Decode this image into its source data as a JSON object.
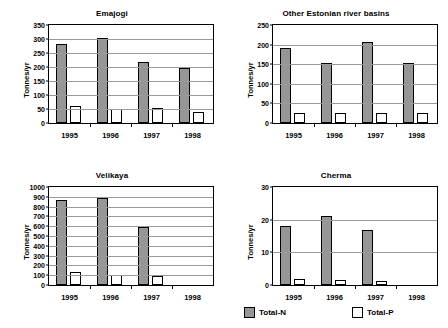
{
  "figure": {
    "ylabel": "Tonnes/yr",
    "series_colors": {
      "Total-N": "#969696",
      "Total-P": "#ffffff"
    },
    "legend": {
      "position": "bottom-right",
      "entries": [
        {
          "label": "Total-N",
          "swatch": "total-n-swatch"
        },
        {
          "label": "Total-P",
          "swatch": "total-p-swatch"
        }
      ]
    }
  },
  "chart_data": [
    {
      "type": "bar",
      "title": "Emajogi",
      "xlabel": "",
      "ylabel": "Tonnes/yr",
      "categories": [
        "1995",
        "1996",
        "1997",
        "1998"
      ],
      "ylim": [
        0,
        350
      ],
      "yticks": [
        0,
        50,
        100,
        150,
        200,
        250,
        300,
        350
      ],
      "grid": true,
      "series": [
        {
          "name": "Total-N",
          "values": [
            283,
            304,
            217,
            196
          ]
        },
        {
          "name": "Total-P",
          "values": [
            60,
            50,
            55,
            38
          ]
        }
      ]
    },
    {
      "type": "bar",
      "title": "Other Estonian river basins",
      "xlabel": "",
      "ylabel": "Tonnes/yr",
      "categories": [
        "1995",
        "1996",
        "1997",
        "1998"
      ],
      "ylim": [
        0,
        250
      ],
      "yticks": [
        0,
        50,
        100,
        150,
        200,
        250
      ],
      "grid": true,
      "series": [
        {
          "name": "Total-N",
          "values": [
            192,
            153,
            207,
            152
          ]
        },
        {
          "name": "Total-P",
          "values": [
            25,
            25,
            26,
            25
          ]
        }
      ]
    },
    {
      "type": "bar",
      "title": "Velikaya",
      "xlabel": "",
      "ylabel": "Tonnes/yr",
      "categories": [
        "1995",
        "1996",
        "1997",
        "1998"
      ],
      "ylim": [
        0,
        1000
      ],
      "yticks": [
        0,
        100,
        200,
        300,
        400,
        500,
        600,
        700,
        800,
        900,
        1000
      ],
      "grid": true,
      "series": [
        {
          "name": "Total-N",
          "values": [
            865,
            890,
            592,
            null
          ]
        },
        {
          "name": "Total-P",
          "values": [
            137,
            98,
            90,
            null
          ]
        }
      ]
    },
    {
      "type": "bar",
      "title": "Cherma",
      "xlabel": "",
      "ylabel": "Tonnes/yr",
      "categories": [
        "1995",
        "1996",
        "1997",
        "1998"
      ],
      "ylim": [
        0,
        30
      ],
      "yticks": [
        0,
        10,
        20,
        30
      ],
      "grid": true,
      "series": [
        {
          "name": "Total-N",
          "values": [
            18.1,
            21.2,
            16.7,
            null
          ]
        },
        {
          "name": "Total-P",
          "values": [
            1.7,
            1.4,
            1.3,
            null
          ]
        }
      ]
    }
  ]
}
